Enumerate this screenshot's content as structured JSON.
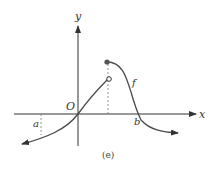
{
  "figure": {
    "caption": "(e)",
    "axis_labels": {
      "x": "x",
      "y": "y"
    },
    "origin_label": "O",
    "point_labels": {
      "a": "a",
      "b": "b"
    },
    "function_label": "f",
    "colors": {
      "ink": "#333333",
      "curve": "#4a4a4a",
      "dashed": "#777777"
    }
  }
}
